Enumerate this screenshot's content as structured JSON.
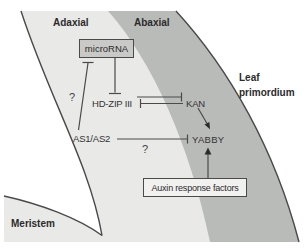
{
  "figure": {
    "regions": {
      "adaxial": {
        "label": "Adaxial"
      },
      "abaxial": {
        "label": "Abaxial"
      },
      "leaf_primordium": {
        "label_line1": "Leaf",
        "label_line2": "primordium"
      },
      "meristem": {
        "label": "Meristem"
      }
    },
    "nodes": {
      "microrna": {
        "label": "microRNA",
        "boxed": true
      },
      "hdzip3": {
        "label": "HD-ZIP III"
      },
      "kan": {
        "label": "KAN"
      },
      "as1as2": {
        "label": "AS1/AS2"
      },
      "yabby": {
        "label": "YABBY"
      },
      "auxin_response_factors": {
        "label": "Auxin response factors",
        "boxed": true
      }
    },
    "annotations": {
      "question_left": "?",
      "question_middle": "?"
    },
    "edges": [
      {
        "from": "microRNA",
        "to": "HD-ZIP III",
        "type": "inhibition"
      },
      {
        "from": "AS1/AS2",
        "to": "microRNA",
        "type": "inhibition",
        "label": "?"
      },
      {
        "from": "HD-ZIP III",
        "to": "KAN",
        "type": "inhibition"
      },
      {
        "from": "KAN",
        "to": "HD-ZIP III",
        "type": "inhibition"
      },
      {
        "from": "KAN",
        "to": "YABBY",
        "type": "activation"
      },
      {
        "from": "AS1/AS2",
        "to": "YABBY",
        "type": "inhibition",
        "label": "?"
      },
      {
        "from": "Auxin response factors",
        "to": "YABBY",
        "type": "activation"
      }
    ],
    "colors": {
      "background": "#ffffff",
      "adaxial_fill": "#e9e9e7",
      "abaxial_fill": "#b9bbb9",
      "meristem_fill": "#e9e9e7",
      "microrna_box_fill": "#c9c9c7",
      "arf_box_fill": "#f1f1ef",
      "outline": "#4a4a4a",
      "text": "#2b2b2b"
    }
  }
}
